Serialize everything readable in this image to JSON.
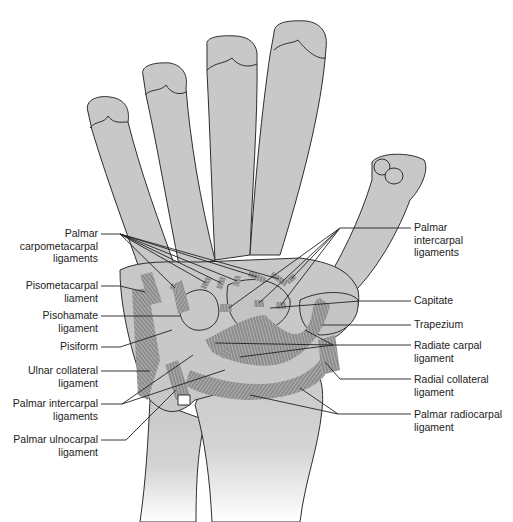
{
  "figure": {
    "colors": {
      "bone": "#c8c8c8",
      "outline": "#2e2e2e",
      "ligament": "#6a6a6a",
      "leader": "#222222",
      "background": "#ffffff"
    }
  },
  "labels": {
    "left": [
      {
        "id": "palmar-carpometacarpal",
        "lines": [
          "Palmar",
          "carpometacarpal",
          "ligaments"
        ]
      },
      {
        "id": "pisometacarpal",
        "lines": [
          "Pisometacarpal",
          "liament"
        ]
      },
      {
        "id": "pisohamate",
        "lines": [
          "Pisohamate",
          "ligament"
        ]
      },
      {
        "id": "pisiform",
        "lines": [
          "Pisiform"
        ]
      },
      {
        "id": "ulnar-collateral",
        "lines": [
          "Ulnar collateral",
          "ligament"
        ]
      },
      {
        "id": "palmar-intercarpal-left",
        "lines": [
          "Palmar intercarpal",
          "ligaments"
        ]
      },
      {
        "id": "palmar-ulnocarpal",
        "lines": [
          "Palmar ulnocarpal",
          "ligament"
        ]
      }
    ],
    "right": [
      {
        "id": "palmar-intercarpal-right",
        "lines": [
          "Palmar",
          "intercarpal",
          "ligaments"
        ]
      },
      {
        "id": "capitate",
        "lines": [
          "Capitate"
        ]
      },
      {
        "id": "trapezium",
        "lines": [
          "Trapezium"
        ]
      },
      {
        "id": "radiate-carpal",
        "lines": [
          "Radiate carpal",
          "ligament"
        ]
      },
      {
        "id": "radial-collateral",
        "lines": [
          "Radial collateral",
          "ligament"
        ]
      },
      {
        "id": "palmar-radiocarpal",
        "lines": [
          "Palmar radiocarpal",
          "ligament"
        ]
      }
    ]
  }
}
